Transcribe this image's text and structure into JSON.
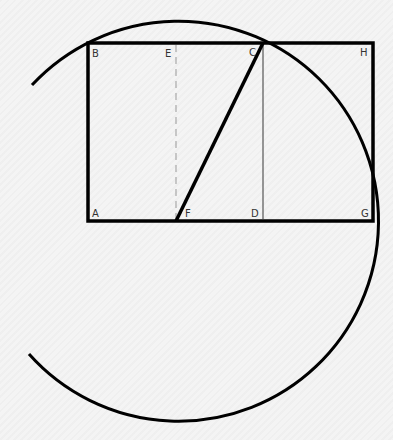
{
  "diagram": {
    "colors": {
      "background": "#f4f4f4",
      "stroke": "#000000",
      "thin_stroke": "#555555",
      "dashed_stroke": "#999999",
      "label": "#333333"
    },
    "points": {
      "A": {
        "label": "A",
        "x": 88,
        "y": 221
      },
      "B": {
        "label": "B",
        "x": 88,
        "y": 43
      },
      "C": {
        "label": "C",
        "x": 263,
        "y": 43
      },
      "D": {
        "label": "D",
        "x": 263,
        "y": 221
      },
      "E": {
        "label": "E",
        "x": 176,
        "y": 43
      },
      "F": {
        "label": "F",
        "x": 176,
        "y": 221
      },
      "G": {
        "label": "G",
        "x": 373,
        "y": 221
      },
      "H": {
        "label": "H",
        "x": 373,
        "y": 43
      }
    },
    "labels": {
      "A": "A",
      "B": "B",
      "C": "C",
      "D": "D",
      "E": "E",
      "F": "F",
      "G": "G",
      "H": "H"
    },
    "shapes": {
      "square": "ABCD",
      "golden_rectangle": "ABHG",
      "diagonal": "FC",
      "midline_dashed": "EF",
      "divider_thin": "CD",
      "arc": "circle centered at F through C and G"
    }
  }
}
